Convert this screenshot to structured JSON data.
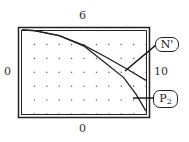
{
  "chart_data": {
    "type": "line",
    "title": "",
    "window": {
      "ymax_label": "6",
      "ymin_label": "0",
      "xmin_label": "0",
      "xmax_label": "10"
    },
    "xlim": [
      0,
      10
    ],
    "ylim": [
      0,
      6
    ],
    "grid": "dots",
    "series": [
      {
        "name": "N'",
        "points": [
          [
            0,
            6.0
          ],
          [
            1,
            5.95
          ],
          [
            3,
            5.6
          ],
          [
            5,
            4.9
          ],
          [
            6.5,
            4.2
          ],
          [
            8.5,
            3.2
          ],
          [
            10,
            2.4
          ]
        ]
      },
      {
        "name": "P2",
        "points": [
          [
            0,
            6.0
          ],
          [
            1,
            5.95
          ],
          [
            3,
            5.6
          ],
          [
            5,
            4.85
          ],
          [
            6.5,
            3.8
          ],
          [
            8.2,
            2.6
          ],
          [
            9.2,
            1.4
          ],
          [
            10,
            0.2
          ]
        ]
      }
    ],
    "annotations": [
      {
        "label": "N'",
        "target_series": "N'"
      },
      {
        "label": "P",
        "subscript": "2",
        "target_series": "P2"
      }
    ]
  },
  "labels": {
    "top": "6",
    "bottom": "0",
    "left": "0",
    "right": "10"
  },
  "callouts": {
    "n_prime": "N'",
    "p2_main": "P",
    "p2_sub": "2"
  },
  "colors": {
    "line": "#222222",
    "frame": "#222222",
    "dot": "#555555",
    "background": "#ffffff"
  }
}
